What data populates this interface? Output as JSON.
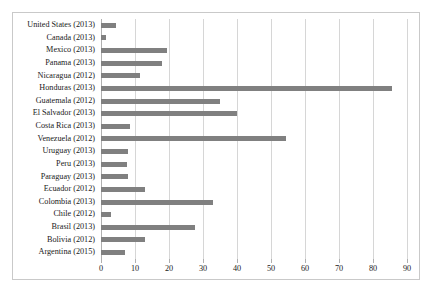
{
  "chart_data": {
    "type": "bar",
    "orientation": "horizontal",
    "title": "",
    "subtitle": "",
    "xlabel": "",
    "ylabel": "",
    "xlim": [
      0,
      90
    ],
    "xticks": [
      0,
      10,
      20,
      30,
      40,
      50,
      60,
      70,
      80,
      90
    ],
    "grid": true,
    "legend": false,
    "bar_color": "#808080",
    "categories": [
      "United States (2013)",
      "Canada (2013)",
      "Mexico (2013)",
      "Panama (2013)",
      "Nicaragua (2012)",
      "Honduras (2013)",
      "Guatemala (2012)",
      "El Salvador (2013)",
      "Costa Rica (2013)",
      "Venezuela (2012)",
      "Uruguay (2013)",
      "Peru (2013)",
      "Paraguay (2013)",
      "Ecuador (2012)",
      "Colombia (2013)",
      "Chile (2012)",
      "Brasil (2013)",
      "Bolivia (2012)",
      "Argentina (2015)"
    ],
    "values": [
      4.5,
      1.5,
      19.5,
      18,
      11.5,
      85.5,
      35,
      40,
      8.5,
      54.5,
      8,
      7.5,
      8,
      13,
      33,
      3,
      27.5,
      13,
      7
    ]
  }
}
